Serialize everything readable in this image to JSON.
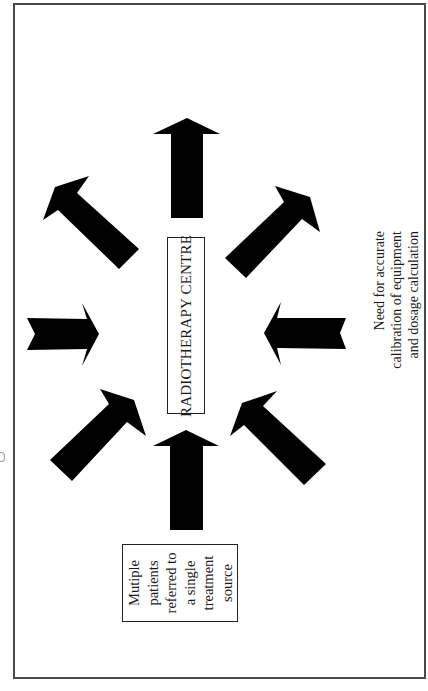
{
  "diagram": {
    "frame": {
      "border_color": "#4a4a4a"
    },
    "center_node": {
      "label": "RADIOTHERAPY CENTRE",
      "orientation": "rotated -90deg"
    },
    "source_note": {
      "lines": [
        "Mutiple",
        "patients",
        "referred to",
        "a single",
        "treatment",
        "source"
      ]
    },
    "side_note": {
      "lines": [
        "Need for accurate",
        "calibration of equipment",
        "and dosage calculation"
      ]
    },
    "arrows": [
      {
        "name": "arrow-top",
        "direction": "up",
        "icon": "arrow-up-icon"
      },
      {
        "name": "arrow-bottom",
        "direction": "up",
        "icon": "arrow-up-icon"
      },
      {
        "name": "arrow-left",
        "direction": "right",
        "icon": "arrow-right-icon"
      },
      {
        "name": "arrow-right",
        "direction": "left",
        "icon": "arrow-left-icon"
      },
      {
        "name": "arrow-upper-left",
        "direction": "up-left",
        "icon": "arrow-up-left-icon"
      },
      {
        "name": "arrow-upper-right",
        "direction": "up-right",
        "icon": "arrow-up-right-icon"
      },
      {
        "name": "arrow-lower-left",
        "direction": "up-right",
        "icon": "arrow-up-right-icon"
      },
      {
        "name": "arrow-lower-right",
        "direction": "up-left",
        "icon": "arrow-up-left-icon"
      }
    ],
    "colors": {
      "arrow_fill": "#000000",
      "text": "#1a1a1a",
      "background": "#ffffff"
    }
  }
}
